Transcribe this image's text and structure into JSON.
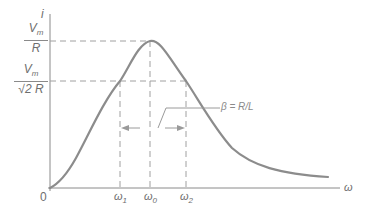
{
  "diagram": {
    "type": "resonance-curve",
    "y_axis_label": "i",
    "x_axis_label": "ω",
    "origin_label": "0",
    "y_labels": [
      {
        "numerator": "V",
        "numerator_sub": "m",
        "denominator": "R"
      },
      {
        "numerator": "V",
        "numerator_sub": "m",
        "denominator": "√2 R"
      }
    ],
    "x_ticks": [
      {
        "symbol": "ω",
        "sub": "1"
      },
      {
        "symbol": "ω",
        "sub": "0"
      },
      {
        "symbol": "ω",
        "sub": "2"
      }
    ],
    "bandwidth_label": "β = R/L",
    "colors": {
      "curve": "#8c8c8c",
      "axes": "#8a8a8a",
      "dashed": "#a0a0a0",
      "text": "#6e6e6e"
    }
  }
}
